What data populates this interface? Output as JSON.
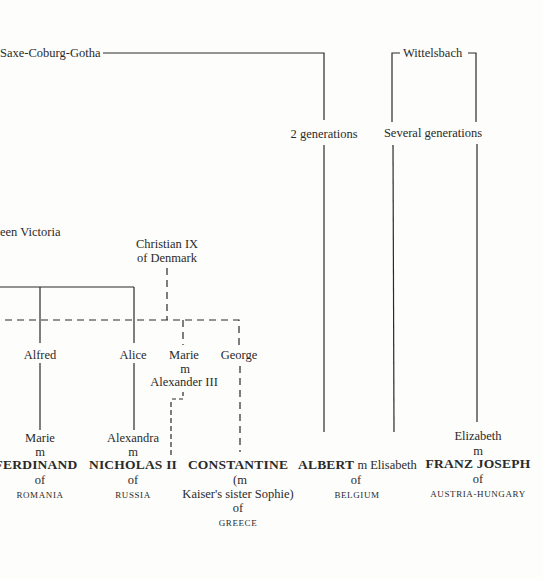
{
  "houses": {
    "saxe_coburg": "Saxe-Coburg-Gotha",
    "wittelsbach": "Wittelsbach"
  },
  "gaps": {
    "two_generations": "2 generations",
    "several_generations": "Several generations"
  },
  "ancestors": {
    "victoria": "een Victoria",
    "christian_line1": "Christian IX",
    "christian_line2": "of Denmark"
  },
  "children": {
    "alfred": "Alfred",
    "alice": "Alice",
    "marie": "Marie",
    "marie_m": "m",
    "alexander": "Alexander III",
    "george": "George"
  },
  "monarchs": [
    {
      "spouse": "Marie",
      "m": "m",
      "name": "FERDINAND",
      "of": "of",
      "country": "ROMANIA"
    },
    {
      "spouse": "Alexandra",
      "m": "m",
      "name": "NICHOLAS II",
      "of": "of",
      "country": "RUSSIA"
    },
    {
      "name": "CONSTANTINE",
      "note1": "(m",
      "note2": "Kaiser's sister Sophie)",
      "of": "of",
      "country": "GREECE"
    },
    {
      "name": "ALBERT",
      "m": "m",
      "spouse": "Elisabeth",
      "of": "of",
      "country": "BELGIUM"
    },
    {
      "spouse": "Elizabeth",
      "m": "m",
      "name": "FRANZ JOSEPH",
      "of": "of",
      "country": "AUSTRIA-HUNGARY"
    }
  ]
}
